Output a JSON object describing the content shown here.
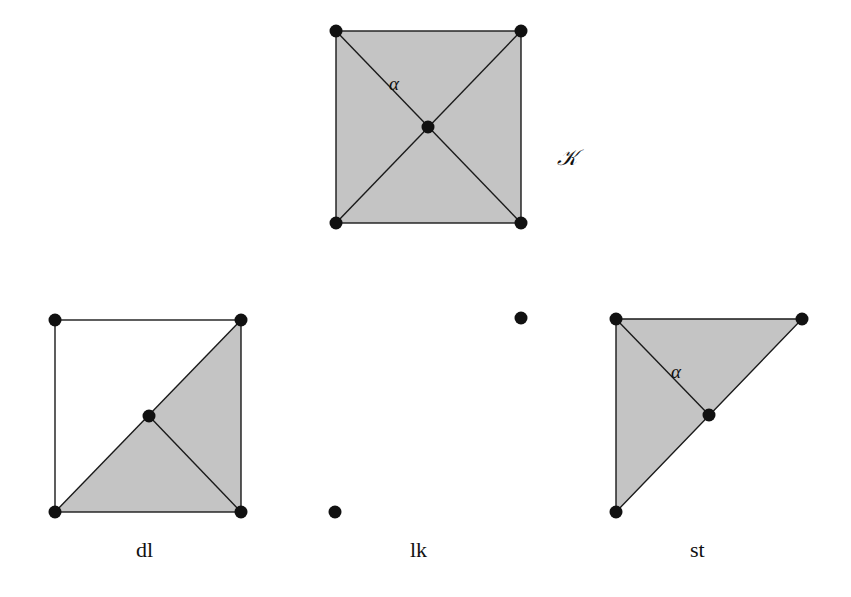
{
  "figures": {
    "complex": {
      "label": "𝒦",
      "edge_label": "α",
      "vertices": [
        [
          336,
          31
        ],
        [
          521,
          31
        ],
        [
          336,
          223
        ],
        [
          521,
          223
        ],
        [
          428,
          127
        ]
      ]
    },
    "deletion": {
      "label": "dl",
      "vertices": [
        [
          55,
          320
        ],
        [
          241,
          320
        ],
        [
          55,
          512
        ],
        [
          241,
          512
        ],
        [
          149,
          416
        ]
      ]
    },
    "link": {
      "label": "lk",
      "vertices": [
        [
          521,
          318
        ],
        [
          335,
          512
        ]
      ]
    },
    "star": {
      "label": "st",
      "edge_label": "α",
      "vertices": [
        [
          616,
          319
        ],
        [
          802,
          319
        ],
        [
          616,
          512
        ],
        [
          709,
          415
        ]
      ]
    }
  },
  "colors": {
    "fill": "#c4c4c4",
    "edge": "#1a1a1a",
    "vertex": "#111111"
  }
}
